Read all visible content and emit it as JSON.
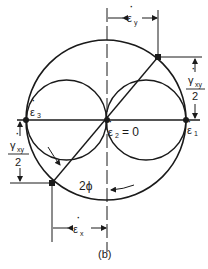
{
  "diagram": {
    "type": "mohr-circle-strain-rate",
    "caption": "(b)",
    "labels": {
      "eps_y": "ε",
      "eps_y_sub": "y",
      "eps_x": "ε",
      "eps_x_sub": "x",
      "eps_1": "ε",
      "eps_1_sub": "1",
      "eps_2": "ε",
      "eps_2_sub": "2",
      "eps_2_value": "= 0",
      "eps_3": "ε",
      "eps_3_sub": "3",
      "gamma_right": "γ",
      "gamma_right_sub": "xy",
      "gamma_right_den": "2",
      "gamma_left": "γ",
      "gamma_left_sub": "xy",
      "gamma_left_den": "2",
      "angle": "2ϕ"
    },
    "colors": {
      "stroke": "#1a1a1a",
      "background": "#ffffff"
    }
  }
}
